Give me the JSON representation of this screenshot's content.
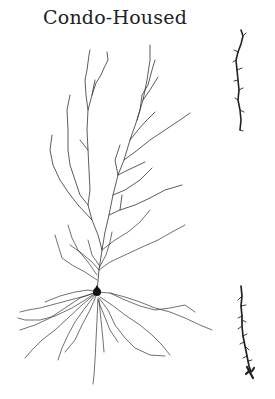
{
  "figure": {
    "title": "Condo-Housed",
    "neuron": {
      "type": "pyramidal-neuron-tracing",
      "soma": {
        "x": 97,
        "y": 292
      },
      "stroke_color": "#333333"
    },
    "spine_segments": [
      {
        "label": "apical-dendrite-segment",
        "position": "top-right"
      },
      {
        "label": "basal-dendrite-segment",
        "position": "bottom-right"
      }
    ]
  }
}
